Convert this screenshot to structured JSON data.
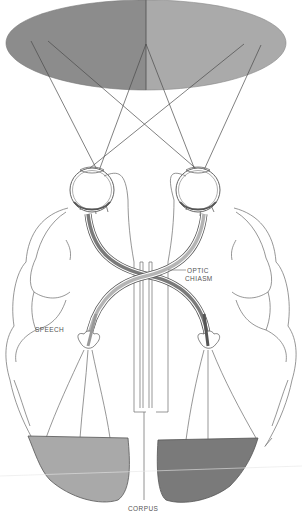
{
  "figure": {
    "labels": {
      "optic_chiasm_line1": "OPTIC",
      "optic_chiasm_line2": "CHIASM",
      "speech": "SPEECH",
      "corpus": "CORPUS"
    },
    "regions": {
      "visual_field_left": "left half of visual field",
      "visual_field_right": "right half of visual field",
      "visual_cortex_left": "left visual cortex",
      "visual_cortex_right": "right visual cortex"
    },
    "colors": {
      "field_left": "#8c8c8c",
      "field_right": "#aaaaaa",
      "cortex_left": "#a9a9a9",
      "cortex_right": "#7a7a7a",
      "tract_dark": "#7a7a7a",
      "tract_light": "#b4b4b4",
      "line": "#6a6a6a"
    }
  }
}
